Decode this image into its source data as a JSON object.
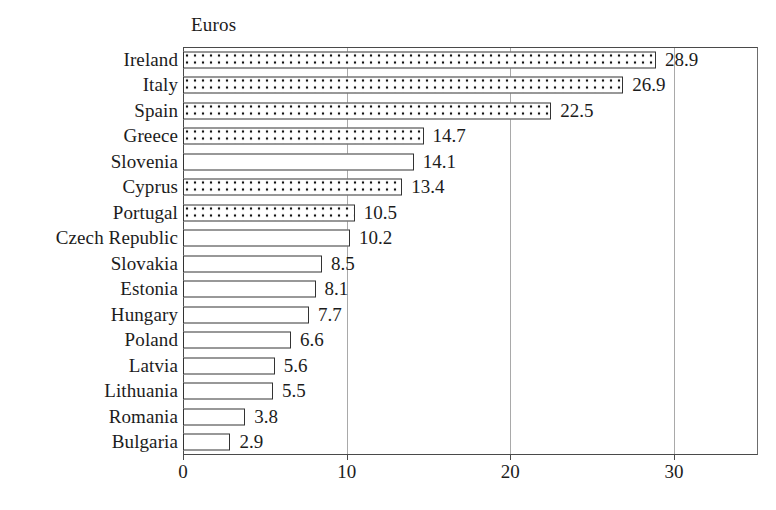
{
  "chart_data": {
    "type": "bar",
    "orientation": "horizontal",
    "title": "Euros",
    "xlabel": "",
    "ylabel": "",
    "xlim": [
      0,
      35.1
    ],
    "xticks": [
      0,
      10,
      20,
      30
    ],
    "xtick_labels": [
      "0",
      "10",
      "20",
      "30"
    ],
    "grid": "vertical",
    "legend": null,
    "categories": [
      "Ireland",
      "Italy",
      "Spain",
      "Greece",
      "Slovenia",
      "Cyprus",
      "Portugal",
      "Czech Republic",
      "Slovakia",
      "Estonia",
      "Hungary",
      "Poland",
      "Latvia",
      "Lithuania",
      "Romania",
      "Bulgaria"
    ],
    "values": [
      28.9,
      26.9,
      22.5,
      14.7,
      14.1,
      13.4,
      10.5,
      10.2,
      8.5,
      8.1,
      7.7,
      6.6,
      5.6,
      5.5,
      3.8,
      2.9
    ],
    "value_labels": [
      "28.9",
      "26.9",
      "22.5",
      "14.7",
      "14.1",
      "13.4",
      "10.5",
      "10.2",
      "8.5",
      "8.1",
      "7.7",
      "6.6",
      "5.6",
      "5.5",
      "3.8",
      "2.9"
    ],
    "fills": [
      "dotted",
      "dotted",
      "dotted",
      "dotted",
      "plain",
      "dotted",
      "dotted",
      "plain",
      "plain",
      "plain",
      "plain",
      "plain",
      "plain",
      "plain",
      "plain",
      "plain"
    ],
    "colors": {
      "bar_fill": "#ffffff",
      "bar_border": "#333333",
      "dot": "#111111",
      "gridline": "#a9a9a9",
      "axis": "#4a4a4a",
      "text": "#1c1c1c",
      "background": "#ffffff"
    }
  }
}
